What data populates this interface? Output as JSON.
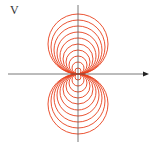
{
  "diagram": {
    "axis_label": "V",
    "origin": [
      78,
      74
    ],
    "colors": {
      "circles": "#e8401c",
      "axes": "#555555"
    },
    "circle_radii": [
      3,
      6,
      9,
      12,
      15,
      18,
      21,
      24,
      27,
      30
    ],
    "lobes": [
      "top",
      "bottom"
    ]
  }
}
